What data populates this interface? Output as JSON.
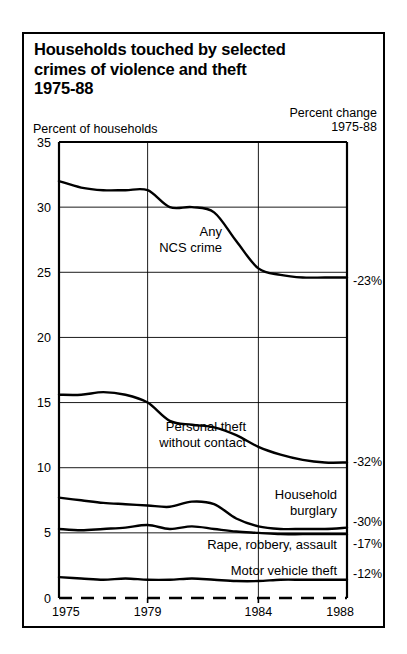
{
  "title": {
    "line1": "Households touched by selected",
    "line2": "crimes of violence and theft",
    "line3": "1975-88"
  },
  "captions": {
    "y_axis": "Percent of households",
    "pct_change_line1": "Percent change",
    "pct_change_line2": "1975-88"
  },
  "chart_data": {
    "type": "line",
    "title": "Households touched by selected crimes of violence and theft 1975-88",
    "xlabel": "",
    "ylabel": "Percent of households",
    "xlim": [
      1975,
      1988
    ],
    "ylim": [
      0,
      35
    ],
    "yticks": [
      0,
      5,
      10,
      15,
      20,
      25,
      30,
      35
    ],
    "ytick_labels": [
      "0",
      "5",
      "10",
      "15",
      "20",
      "25",
      "30",
      "35"
    ],
    "xticks": [
      1975,
      1979,
      1984,
      1988
    ],
    "xtick_labels": [
      "1975",
      "1979",
      "1984",
      "1988"
    ],
    "grid": "horizontal-and-vertical-at-ticks",
    "legend": "inline-annotations",
    "x": [
      1975,
      1976,
      1977,
      1978,
      1979,
      1980,
      1981,
      1982,
      1983,
      1984,
      1985,
      1986,
      1987,
      1988
    ],
    "series": [
      {
        "name": "Any NCS crime",
        "label": "Any\nNCS crime",
        "label_line1": "Any",
        "label_line2": "NCS crime",
        "percent_change": "-23%",
        "values": [
          32.0,
          31.5,
          31.3,
          31.3,
          31.3,
          30.0,
          30.0,
          29.6,
          27.4,
          25.3,
          24.8,
          24.6,
          24.6,
          24.6
        ]
      },
      {
        "name": "Personal theft without contact",
        "label": "Personal theft\nwithout contact",
        "label_line1": "Personal theft",
        "label_line2": "without contact",
        "percent_change": "-32%",
        "values": [
          15.6,
          15.6,
          15.8,
          15.6,
          15.0,
          13.6,
          13.3,
          13.1,
          12.5,
          11.6,
          11.0,
          10.6,
          10.4,
          10.4
        ]
      },
      {
        "name": "Household burglary",
        "label": "Household\nburglary",
        "label_line1": "Household",
        "label_line2": "burglary",
        "percent_change": "-30%",
        "values": [
          7.7,
          7.5,
          7.3,
          7.2,
          7.1,
          7.0,
          7.4,
          7.2,
          6.1,
          5.5,
          5.3,
          5.3,
          5.3,
          5.4
        ]
      },
      {
        "name": "Rape, robbery, assault",
        "label": "Rape, robbery, assault",
        "percent_change": "-17%",
        "values": [
          5.3,
          5.2,
          5.3,
          5.4,
          5.6,
          5.3,
          5.5,
          5.3,
          5.1,
          5.0,
          4.9,
          4.9,
          4.9,
          4.9
        ]
      },
      {
        "name": "Motor vehicle theft",
        "label": "Motor vehicle theft",
        "percent_change": "-12%",
        "values": [
          1.6,
          1.5,
          1.4,
          1.5,
          1.4,
          1.4,
          1.5,
          1.4,
          1.3,
          1.3,
          1.4,
          1.4,
          1.4,
          1.4
        ]
      }
    ]
  }
}
